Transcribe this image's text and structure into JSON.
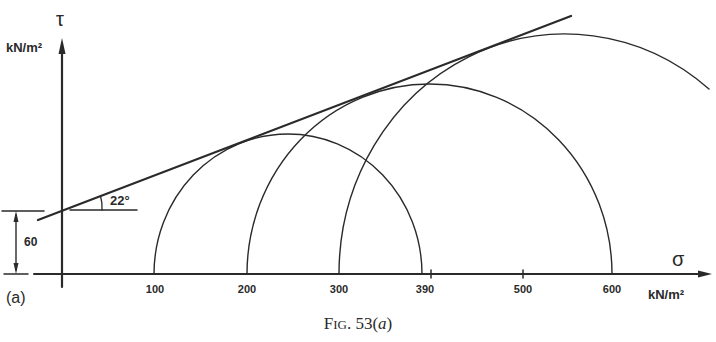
{
  "figure": {
    "caption_prefix": "F",
    "caption_smallcaps": "IG",
    "caption_rest": ". 53(",
    "caption_italic": "a",
    "caption_end": ")",
    "panel_label": "(a)",
    "line_color": "#2a2a2a"
  },
  "axes": {
    "y_symbol": "τ",
    "y_unit": "kN/m²",
    "x_symbol": "σ",
    "x_unit": "kN/m²",
    "x_ticks": [
      "100",
      "200",
      "300",
      "390",
      "500",
      "600"
    ]
  },
  "annotations": {
    "intercept_value": "60",
    "angle_label": "22°"
  },
  "diagram": {
    "type": "Mohr circles with Coulomb failure envelope",
    "cohesion_c": 60,
    "friction_angle_deg": 22,
    "circles": [
      {
        "sigma3": 100,
        "sigma1": 390
      },
      {
        "sigma3": 200,
        "sigma1": 600
      },
      {
        "sigma3": 300,
        "sigma1": "off-figure"
      }
    ]
  }
}
